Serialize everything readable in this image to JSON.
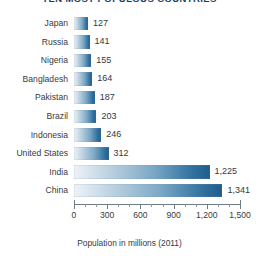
{
  "chart_data": {
    "type": "bar",
    "orientation": "horizontal",
    "title": "TEN MOST POPULOUS COUNTRIES",
    "xlabel": "Population in millions (2011)",
    "ylabel": "",
    "xlim": [
      0,
      1500
    ],
    "xticks": [
      0,
      300,
      600,
      900,
      1200,
      1500
    ],
    "xtick_labels": [
      "0",
      "300",
      "600",
      "900",
      "1,200",
      "1,500"
    ],
    "minor_tick_step": 100,
    "grid": false,
    "legend": false,
    "categories": [
      "Japan",
      "Russia",
      "Nigeria",
      "Bangladesh",
      "Pakistan",
      "Brazil",
      "Indonesia",
      "United States",
      "India",
      "China"
    ],
    "values": [
      127,
      141,
      155,
      164,
      187,
      203,
      246,
      312,
      1225,
      1341
    ],
    "value_labels": [
      "127",
      "141",
      "155",
      "164",
      "187",
      "203",
      "246",
      "312",
      "1,225",
      "1,341"
    ],
    "bar_gradient": {
      "from": "#eef3f7",
      "mid": "#7da8c6",
      "to": "#1f5c8b"
    },
    "axis_color": "#6e7b85",
    "text_color": "#3a3a3a",
    "title_color": "#1d3f5e",
    "background": "#ffffff"
  }
}
